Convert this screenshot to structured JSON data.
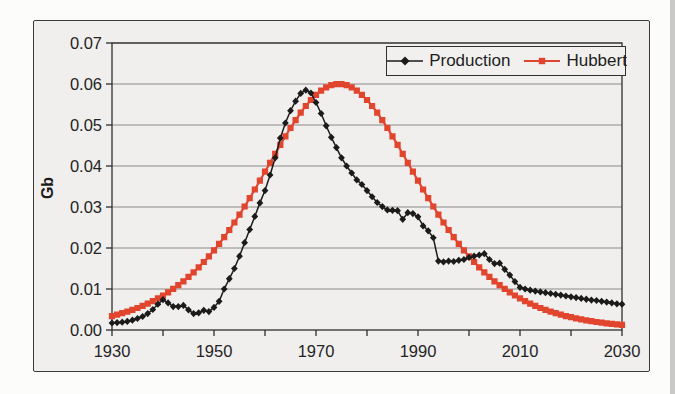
{
  "figure": {
    "kind": "scanned-book-figure",
    "background_color": "#f0efed",
    "frame_border_color": "#3a3a3a"
  },
  "chart_data": {
    "type": "line",
    "title": "",
    "xlabel": "",
    "ylabel": "Gb",
    "xlim": [
      1930,
      2030
    ],
    "ylim": [
      0,
      0.07
    ],
    "x_tick_labels": [
      "1930",
      "1950",
      "1970",
      "1990",
      "2010",
      "2030"
    ],
    "x_minor_tick_step": 10,
    "y_tick_labels": [
      "0.00",
      "0.01",
      "0.02",
      "0.03",
      "0.04",
      "0.05",
      "0.06",
      "0.07"
    ],
    "grid": "horizontal-only",
    "grid_color": "#8a8a8a",
    "axis_color": "#2e2e2e",
    "text_color": "#242424",
    "legend": {
      "position": "top-right-inside",
      "border_color": "#2f2f2f",
      "entries": [
        {
          "label": "Production",
          "marker": "diamond",
          "color": "#1b1b1b"
        },
        {
          "label": "Hubbert",
          "marker": "square",
          "color": "#e2452e"
        }
      ]
    },
    "series": [
      {
        "name": "Production",
        "color": "#1b1b1b",
        "marker": "diamond",
        "x_start": 1930,
        "x_step": 1,
        "values": [
          0.0017,
          0.0018,
          0.0019,
          0.0021,
          0.0024,
          0.0028,
          0.0033,
          0.004,
          0.005,
          0.0063,
          0.0074,
          0.0066,
          0.0057,
          0.0057,
          0.006,
          0.0049,
          0.004,
          0.0042,
          0.0048,
          0.0045,
          0.0055,
          0.007,
          0.01,
          0.0125,
          0.015,
          0.018,
          0.0213,
          0.0245,
          0.0277,
          0.031,
          0.034,
          0.0378,
          0.042,
          0.0468,
          0.0505,
          0.0535,
          0.0558,
          0.0577,
          0.0585,
          0.0578,
          0.0555,
          0.0528,
          0.0498,
          0.047,
          0.0445,
          0.042,
          0.04,
          0.0383,
          0.0366,
          0.0355,
          0.034,
          0.0325,
          0.0311,
          0.0301,
          0.0293,
          0.0292,
          0.0291,
          0.027,
          0.0286,
          0.0284,
          0.0276,
          0.0254,
          0.0242,
          0.0225,
          0.0168,
          0.0166,
          0.0168,
          0.0167,
          0.017,
          0.0172,
          0.0177,
          0.018,
          0.0183,
          0.0186,
          0.0172,
          0.0162,
          0.0163,
          0.0148,
          0.0134,
          0.0118,
          0.0104,
          0.01,
          0.0097,
          0.0095,
          0.0093,
          0.0091,
          0.0089,
          0.0087,
          0.0085,
          0.0083,
          0.0081,
          0.0079,
          0.0077,
          0.0075,
          0.0073,
          0.0072,
          0.007,
          0.0068,
          0.0066,
          0.0064,
          0.0063
        ]
      },
      {
        "name": "Hubbert",
        "color": "#e2452e",
        "marker": "square",
        "x_start": 1930,
        "x_step": 1,
        "values": [
          0.0034,
          0.00373,
          0.00409,
          0.00448,
          0.00491,
          0.00537,
          0.00588,
          0.00644,
          0.00704,
          0.0077,
          0.00842,
          0.00919,
          0.01003,
          0.01092,
          0.01189,
          0.01295,
          0.01407,
          0.01527,
          0.01658,
          0.01796,
          0.01942,
          0.02099,
          0.02264,
          0.02438,
          0.02622,
          0.02813,
          0.03011,
          0.03216,
          0.03427,
          0.03642,
          0.0386,
          0.04079,
          0.04298,
          0.04514,
          0.04724,
          0.04927,
          0.05119,
          0.05299,
          0.05463,
          0.05609,
          0.05734,
          0.05837,
          0.05916,
          0.0597,
          0.05997,
          0.05997,
          0.0597,
          0.05916,
          0.05837,
          0.05734,
          0.05609,
          0.05463,
          0.05299,
          0.05119,
          0.04927,
          0.04724,
          0.04514,
          0.04298,
          0.04079,
          0.0386,
          0.03642,
          0.03427,
          0.03216,
          0.03011,
          0.02813,
          0.02622,
          0.02438,
          0.02264,
          0.02099,
          0.01942,
          0.01796,
          0.01658,
          0.01527,
          0.01407,
          0.01295,
          0.01189,
          0.01092,
          0.01003,
          0.00919,
          0.00842,
          0.0077,
          0.00704,
          0.00644,
          0.00588,
          0.00537,
          0.00491,
          0.00448,
          0.00409,
          0.00373,
          0.0034,
          0.00311,
          0.00284,
          0.00259,
          0.00236,
          0.00215,
          0.00196,
          0.00179,
          0.00163,
          0.00149,
          0.00136,
          0.00124
        ]
      }
    ]
  }
}
